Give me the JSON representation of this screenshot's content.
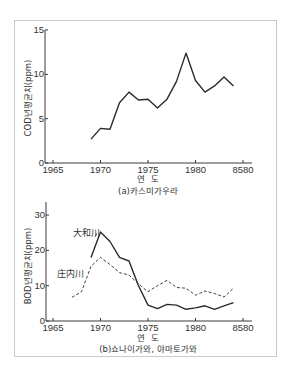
{
  "chart_data": [
    {
      "type": "line",
      "title": "",
      "caption": "(a)카스미가우라",
      "xlabel": "연  도",
      "ylabel": "COD년평균치(ppm)",
      "xlim": [
        1965,
        1985.5
      ],
      "ylim": [
        0,
        15
      ],
      "x_ticks": [
        1965,
        1970,
        1975,
        1980,
        1985
      ],
      "x_tick_labels": [
        "1965",
        "1970",
        "1975",
        "1980",
        "8580"
      ],
      "y_ticks": [
        0,
        5,
        10,
        15
      ],
      "y_tick_labels": [
        "0",
        "5",
        "10",
        "15"
      ],
      "grid": false,
      "legend": "none",
      "series": [
        {
          "name": "COD",
          "style": "solid",
          "x": [
            1969,
            1970,
            1971,
            1972,
            1973,
            1974,
            1975,
            1976,
            1977,
            1978,
            1979,
            1980,
            1981,
            1982,
            1983,
            1984
          ],
          "values": [
            2.7,
            3.9,
            3.8,
            6.8,
            8.0,
            7.1,
            7.2,
            6.2,
            7.2,
            9.2,
            12.4,
            9.3,
            8.0,
            8.7,
            9.7,
            8.7
          ]
        }
      ]
    },
    {
      "type": "line",
      "title": "",
      "caption": "(b)쇼나이가와, 야마토가와",
      "xlabel": "연  도",
      "ylabel": "BOD년평균치(ppm)",
      "xlim": [
        1965,
        1985.5
      ],
      "ylim": [
        0,
        34
      ],
      "x_ticks": [
        1965,
        1970,
        1975,
        1980,
        1985
      ],
      "x_tick_labels": [
        "1965",
        "1970",
        "1975",
        "1980",
        "8580"
      ],
      "y_ticks": [
        0,
        10,
        20,
        30
      ],
      "y_tick_labels": [
        "0",
        "10",
        "20",
        "30"
      ],
      "grid": false,
      "legend": "inline labels",
      "series": [
        {
          "name": "大和川",
          "style": "solid",
          "x": [
            1969,
            1970,
            1971,
            1972,
            1973,
            1974,
            1975,
            1976,
            1977,
            1978,
            1979,
            1980,
            1981,
            1982,
            1983,
            1984
          ],
          "values": [
            18.0,
            25.2,
            22.5,
            18.0,
            17.0,
            10.0,
            4.5,
            3.5,
            4.7,
            4.5,
            3.3,
            3.7,
            4.3,
            3.3,
            4.3,
            5.2
          ]
        },
        {
          "name": "庄内川",
          "style": "dashed",
          "x": [
            1967,
            1968,
            1969,
            1970,
            1971,
            1972,
            1973,
            1974,
            1975,
            1976,
            1977,
            1978,
            1979,
            1980,
            1981,
            1982,
            1983,
            1984
          ],
          "values": [
            6.7,
            8.3,
            15.5,
            18.0,
            16.0,
            13.7,
            13.0,
            10.5,
            8.3,
            10.0,
            11.5,
            9.5,
            9.3,
            7.3,
            8.5,
            7.8,
            6.8,
            9.3
          ]
        }
      ]
    }
  ],
  "colors": {
    "line": "#2b2b2b",
    "axis": "#3a3a3a",
    "frame": "#c9c9c9"
  }
}
